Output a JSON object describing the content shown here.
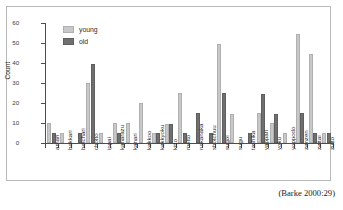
{
  "citation": "(Barke 2000:29)",
  "legend": {
    "position": "top-left-inside",
    "entries": [
      {
        "label": "young",
        "color": "#c8c8c8"
      },
      {
        "label": "old",
        "color": "#6f6f6f"
      }
    ]
  },
  "axis": {
    "y_title": "Count",
    "y_ticks": [
      "0",
      "10",
      "20",
      "30",
      "40",
      "50",
      "60"
    ]
  },
  "chart_data": {
    "type": "bar",
    "title": "",
    "subtitle": "",
    "xlabel": "",
    "ylabel": "Count",
    "ylim": [
      0,
      60
    ],
    "ytick_step": 10,
    "grid": false,
    "legend_position": "top-left-inside",
    "categories": [
      "amari",
      "bakkari",
      "betchari",
      "chotto",
      "ippai",
      "kanarazu",
      "kanari",
      "kekkoo",
      "kekkyoku",
      "kitto",
      "motto",
      "nakanaka",
      "shotchuu",
      "sugoi",
      "sugu",
      "tashika",
      "yappari",
      "yoku",
      "yoppodo",
      "zenzen",
      "zettai",
      "zutto"
    ],
    "series": [
      {
        "name": "young",
        "color": "#c8c8c8",
        "values": [
          10,
          5,
          0,
          30,
          5,
          10,
          10,
          20,
          5,
          9.5,
          25,
          0,
          0,
          49.5,
          14.5,
          0,
          15,
          10,
          5,
          54.5,
          44.5,
          5
        ]
      },
      {
        "name": "old",
        "color": "#6f6f6f",
        "values": [
          5,
          0,
          5,
          39.5,
          0,
          5,
          0,
          0,
          5,
          9.5,
          5,
          15,
          5,
          25,
          0,
          5,
          24.5,
          14.5,
          0,
          15,
          5,
          5
        ]
      }
    ]
  }
}
